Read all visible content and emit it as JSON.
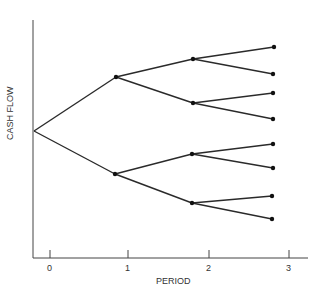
{
  "chart_data": {
    "type": "tree",
    "title": "",
    "xlabel": "PERIOD",
    "ylabel": "CASH FLOW",
    "x_ticks": [
      "0",
      "1",
      "2",
      "3"
    ],
    "nodes": {
      "period0": [
        {
          "id": "n0",
          "x": 34,
          "y": 131
        }
      ],
      "period1": [
        {
          "id": "u",
          "x": 116,
          "y": 77
        },
        {
          "id": "d",
          "x": 115,
          "y": 174
        }
      ],
      "period2": [
        {
          "id": "uu",
          "x": 193,
          "y": 59
        },
        {
          "id": "ud",
          "x": 193,
          "y": 103
        },
        {
          "id": "du",
          "x": 192,
          "y": 154
        },
        {
          "id": "dd",
          "x": 192,
          "y": 203
        }
      ],
      "period3": [
        {
          "id": "uuu",
          "x": 274,
          "y": 47
        },
        {
          "id": "uud",
          "x": 273,
          "y": 74
        },
        {
          "id": "udu",
          "x": 273,
          "y": 93
        },
        {
          "id": "udd",
          "x": 273,
          "y": 119
        },
        {
          "id": "duu",
          "x": 273,
          "y": 144
        },
        {
          "id": "dud",
          "x": 273,
          "y": 168
        },
        {
          "id": "ddu",
          "x": 272,
          "y": 196
        },
        {
          "id": "ddd",
          "x": 272,
          "y": 219
        }
      ]
    },
    "edges": [
      [
        "n0",
        "u"
      ],
      [
        "n0",
        "d"
      ],
      [
        "u",
        "uu"
      ],
      [
        "u",
        "ud"
      ],
      [
        "d",
        "du"
      ],
      [
        "d",
        "dd"
      ],
      [
        "uu",
        "uuu"
      ],
      [
        "uu",
        "uud"
      ],
      [
        "ud",
        "udu"
      ],
      [
        "ud",
        "udd"
      ],
      [
        "du",
        "duu"
      ],
      [
        "du",
        "dud"
      ],
      [
        "dd",
        "ddu"
      ],
      [
        "dd",
        "ddd"
      ]
    ],
    "branching": "binary",
    "periods": 3,
    "terminal_outcomes": 8,
    "grid": false,
    "legend": null
  },
  "axes": {
    "xlabel": "PERIOD",
    "ylabel": "CASH FLOW",
    "ticks": [
      {
        "label": "0",
        "x": 50
      },
      {
        "label": "1",
        "x": 128
      },
      {
        "label": "2",
        "x": 209
      },
      {
        "label": "3",
        "x": 289
      }
    ]
  },
  "colors": {
    "line": "#2a2a2a",
    "axis": "#444444",
    "node": "#111111"
  }
}
